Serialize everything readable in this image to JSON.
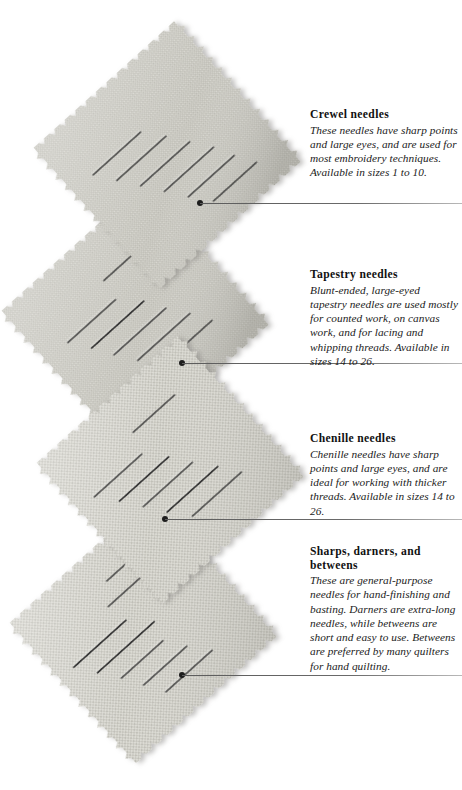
{
  "page": {
    "width": 462,
    "height": 790,
    "background": "#ffffff",
    "illustration_subject": "four pinked linen fabric swatches arranged in a zigzag column, each pierced by a set of hand-sewing needles"
  },
  "colors": {
    "fabric_light": "#d6d5cf",
    "fabric_mid": "#c6c5bd",
    "fabric_shadow": "#a9a8a0",
    "needle": "#3a3a3a",
    "rule": "#5c5c5c",
    "text": "#1b1b1b",
    "title": "#111111"
  },
  "captions": [
    {
      "id": "crewel",
      "title": "Crewel needles",
      "body": "These needles have sharp points and large eyes, and are used for most embroidery techniques. Available in sizes 1 to 10.",
      "top": 108,
      "rule_y": 203,
      "rule_left": 200,
      "leader_dot": {
        "x": 200,
        "y": 203
      }
    },
    {
      "id": "tapestry",
      "title": "Tapestry needles",
      "body": "Blunt-ended, large-eyed tapestry needles are used mostly for counted work, on canvas work, and for lacing and whipping threads. Available in sizes 14 to 26.",
      "top": 268,
      "rule_y": 363,
      "rule_left": 182,
      "leader_dot": {
        "x": 182,
        "y": 363
      }
    },
    {
      "id": "chenille",
      "title": "Chenille needles",
      "body": "Chenille needles have sharp points and large eyes, and are ideal for working with thicker threads. Available in sizes 14 to 26.",
      "top": 432,
      "rule_y": 519,
      "rule_left": 165,
      "leader_dot": {
        "x": 165,
        "y": 519
      }
    },
    {
      "id": "sharps",
      "title": "Sharps, darners, and betweens",
      "body": "These are general-purpose needles for hand-finishing and basting. Darners are extra-long needles, while betweens are short and easy to use. Betweens are preferred by many quilters for hand quilting.",
      "top": 545,
      "rule_y": 675,
      "rule_left": 182,
      "leader_dot": {
        "x": 182,
        "y": 675
      }
    }
  ],
  "swatches": [
    {
      "id": "swatch-crewel",
      "cx": 172,
      "cy": 155,
      "size": 196,
      "rotate": -42,
      "needles": 6
    },
    {
      "id": "swatch-tapestry",
      "cx": 140,
      "cy": 318,
      "size": 196,
      "rotate": -42,
      "needles": 6
    },
    {
      "id": "swatch-chenille",
      "cx": 175,
      "cy": 470,
      "size": 196,
      "rotate": -42,
      "needles": 6
    },
    {
      "id": "swatch-sharps",
      "cx": 148,
      "cy": 630,
      "size": 196,
      "rotate": -42,
      "needles": 7
    }
  ]
}
